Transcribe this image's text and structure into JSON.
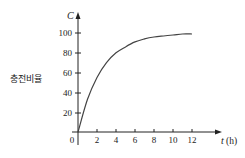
{
  "chart_data": {
    "type": "line",
    "title": "",
    "xlabel": "t (h)",
    "x_var": "t",
    "x_unit": "(h)",
    "ylabel": "충전비율",
    "y_var": "C",
    "x": [
      0,
      1,
      2,
      3,
      4,
      5,
      6,
      7,
      8,
      9,
      10,
      11,
      12
    ],
    "series": [
      {
        "name": "C",
        "values": [
          0,
          33,
          55,
          70,
          80,
          86,
          91,
          94,
          96,
          97,
          98,
          99,
          99
        ]
      }
    ],
    "xticks": [
      2,
      4,
      6,
      8,
      10,
      12
    ],
    "yticks": [
      20,
      40,
      60,
      80,
      100
    ],
    "origin_label": "0",
    "xlim": [
      0,
      15
    ],
    "ylim": [
      0,
      105
    ],
    "grid": false,
    "legend": "none",
    "line_color": "#444444"
  },
  "labels": {
    "y_var": "C",
    "y_title": "충전비율",
    "x_var": "t",
    "x_unit": "(h)",
    "origin": "0",
    "xticks": [
      "2",
      "4",
      "6",
      "8",
      "10",
      "12"
    ],
    "yticks": [
      "20",
      "40",
      "60",
      "80",
      "100"
    ]
  }
}
